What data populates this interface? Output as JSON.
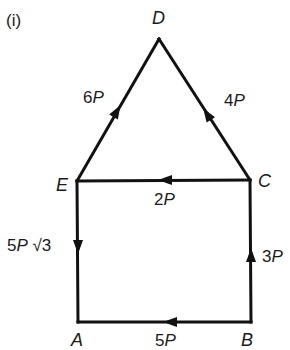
{
  "figure": {
    "label": "(i)"
  },
  "points": {
    "A": {
      "name": "A",
      "x": 78,
      "y": 322
    },
    "B": {
      "name": "B",
      "x": 251,
      "y": 322
    },
    "C": {
      "name": "C",
      "x": 250,
      "y": 180
    },
    "D": {
      "name": "D",
      "x": 159,
      "y": 37
    },
    "E": {
      "name": "E",
      "x": 77,
      "y": 181
    }
  },
  "forces": [
    {
      "edge": "E-D",
      "magnitude": "6",
      "unit": "P",
      "direction": "E to D"
    },
    {
      "edge": "C-D",
      "magnitude": "4",
      "unit": "P",
      "direction": "C to D"
    },
    {
      "edge": "C-E",
      "magnitude": "2",
      "unit": "P",
      "direction": "C to E"
    },
    {
      "edge": "E-A",
      "magnitude": "5",
      "unit": "P",
      "suffix": " √3",
      "direction": "E to A"
    },
    {
      "edge": "B-C",
      "magnitude": "3",
      "unit": "P",
      "direction": "B to C"
    },
    {
      "edge": "B-A",
      "magnitude": "5",
      "unit": "P",
      "direction": "B to A"
    }
  ]
}
